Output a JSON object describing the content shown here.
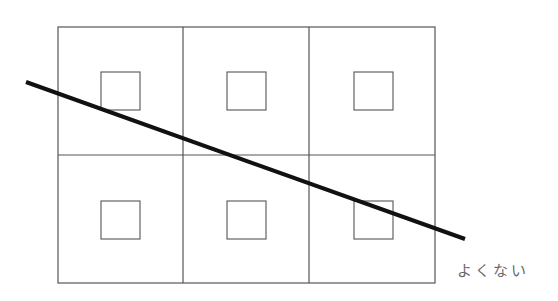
{
  "diagram": {
    "caption": "よくない",
    "colors": {
      "grid_stroke": "#555555",
      "square_stroke": "#555555",
      "diagonal_stroke": "#111111",
      "caption_color": "#6a6a6a",
      "background": "#ffffff"
    },
    "grid": {
      "x": 58,
      "y": 27,
      "width": 377,
      "height": 256,
      "columns": 3,
      "rows": 2,
      "column_dividers": [
        183,
        309
      ],
      "row_dividers": [
        155
      ]
    },
    "inner_squares": [
      {
        "row": 0,
        "col": 0,
        "x": 101,
        "y": 72,
        "w": 39,
        "h": 38
      },
      {
        "row": 0,
        "col": 1,
        "x": 227,
        "y": 72,
        "w": 39,
        "h": 38
      },
      {
        "row": 0,
        "col": 2,
        "x": 354,
        "y": 72,
        "w": 39,
        "h": 38
      },
      {
        "row": 1,
        "col": 0,
        "x": 101,
        "y": 201,
        "w": 39,
        "h": 38
      },
      {
        "row": 1,
        "col": 1,
        "x": 227,
        "y": 201,
        "w": 39,
        "h": 38
      },
      {
        "row": 1,
        "col": 2,
        "x": 354,
        "y": 201,
        "w": 39,
        "h": 38
      }
    ],
    "diagonal_line": {
      "x1": 26,
      "y1": 82,
      "x2": 465,
      "y2": 239,
      "stroke_width": 4
    }
  }
}
